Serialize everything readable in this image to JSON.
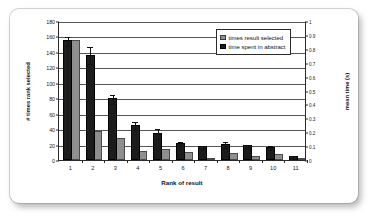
{
  "chart_data": {
    "type": "bar",
    "title": "",
    "subtitle": "",
    "xlabel": "Rank of result",
    "ylabel": "# times rank selected",
    "ylabel_secondary": "mean time (s)",
    "categories": [
      "1",
      "2",
      "3",
      "4",
      "5",
      "6",
      "7",
      "8",
      "9",
      "10",
      "11"
    ],
    "ylim": [
      0,
      180
    ],
    "ytick_step": 20,
    "yticks": [
      "0",
      "20",
      "40",
      "60",
      "80",
      "100",
      "120",
      "140",
      "160",
      "180"
    ],
    "ylim_secondary": [
      0,
      1
    ],
    "ytick_step_secondary": 0.1,
    "yticks_secondary": [
      "0",
      "0.1",
      "0.2",
      "0.3",
      "0.4",
      "0.5",
      "0.6",
      "0.7",
      "0.8",
      "0.9",
      "1"
    ],
    "grid": true,
    "grid_axis": "y",
    "legend_position": "top-right",
    "series": [
      {
        "name": "times result selected",
        "axis": "left",
        "color": "#8f8f8f",
        "values": [
          155,
          38,
          28,
          12,
          14,
          10,
          2,
          9,
          5,
          8,
          3
        ]
      },
      {
        "name": "time spent in abstract",
        "axis": "right",
        "color": "#1c1c1c",
        "values_left_scale": [
          155,
          136,
          80,
          45,
          35,
          22,
          18,
          21,
          19,
          17,
          5
        ],
        "values": [
          0.86,
          0.755,
          0.445,
          0.25,
          0.195,
          0.122,
          0.1,
          0.117,
          0.105,
          0.095,
          0.028
        ],
        "error_upper_left_scale": [
          161,
          147,
          86,
          50,
          41,
          25,
          20,
          25,
          21,
          20,
          7
        ],
        "error_lower_left_scale": [
          149,
          125,
          74,
          40,
          29,
          19,
          16,
          17,
          17,
          14,
          3
        ]
      }
    ]
  },
  "legend": {
    "items": [
      {
        "label": "times result selected",
        "swatch": "gray-swatch"
      },
      {
        "label": "time spent in abstract",
        "swatch": "black-swatch"
      }
    ]
  }
}
